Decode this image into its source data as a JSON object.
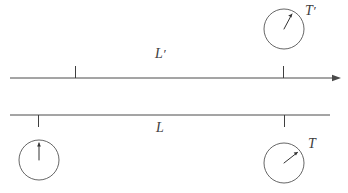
{
  "figure": {
    "background_color": "#ffffff",
    "line_color": "#4a4a4a",
    "text_color": "#3d3d3d",
    "width": 348,
    "height": 193
  },
  "labels": {
    "length_primed": "L",
    "length_primed_prime": "′",
    "length_rest": "L",
    "clock_primed": "T",
    "clock_primed_prime": "′",
    "clock_rest": "T"
  },
  "axes": [
    {
      "name": "primed-frame-axis",
      "label": "L′",
      "has_arrowhead": true,
      "arrow_direction": "right",
      "x_start": 10,
      "x_end": 338,
      "y": 78,
      "tick_direction": "up",
      "ticks": [
        75,
        283
      ]
    },
    {
      "name": "rest-frame-axis",
      "label": "L",
      "has_arrowhead": false,
      "arrow_direction": "none",
      "x_start": 10,
      "x_end": 330,
      "y": 115,
      "tick_direction": "down",
      "ticks": [
        38,
        284
      ]
    }
  ],
  "clocks": [
    {
      "name": "clock-primed-right",
      "label": "T′",
      "cx": 284,
      "cy": 29,
      "r": 20,
      "hand_angle_deg": 28,
      "hand_length": 17,
      "reading": "about 1 o'clock"
    },
    {
      "name": "clock-rest-left",
      "label": "",
      "cx": 39,
      "cy": 160,
      "r": 20,
      "hand_angle_deg": 0,
      "hand_length": 17,
      "reading": "12 o'clock"
    },
    {
      "name": "clock-rest-right",
      "label": "T",
      "cx": 284,
      "cy": 163,
      "r": 20,
      "hand_angle_deg": 52,
      "hand_length": 17,
      "reading": "about 1:45"
    }
  ]
}
